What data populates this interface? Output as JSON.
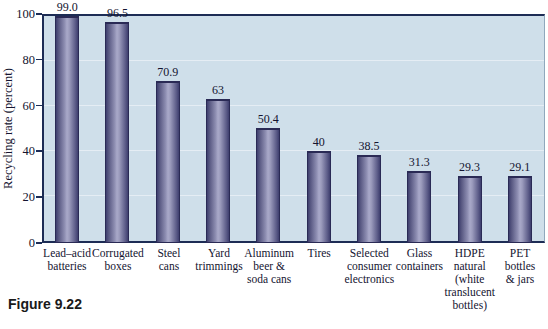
{
  "figure": {
    "caption": "Figure 9.22"
  },
  "colors": {
    "plot_background": "#cfdfea",
    "axis": "#1d2c55",
    "gridline": "#e9f0f6",
    "bar_edge": "#3e3e6e",
    "bar_center": "#a9a9c9",
    "bar_outline": "#2a2a55",
    "text": "#141430"
  },
  "chart_data": {
    "type": "bar",
    "title": "",
    "xlabel": "",
    "ylabel": "Recycling rate (percent)",
    "ylim": [
      0,
      100
    ],
    "yticks": [
      0,
      20,
      40,
      60,
      80,
      100
    ],
    "grid": true,
    "legend": false,
    "categories": [
      "Lead–acid\nbatteries",
      "Corrugated\nboxes",
      "Steel\ncans",
      "Yard\ntrimmings",
      "Aluminum\nbeer &\nsoda cans",
      "Tires",
      "Selected\nconsumer\nelectronics",
      "Glass\ncontainers",
      "HDPE\nnatural\n(white\ntranslucent\nbottles)",
      "PET\nbottles\n& jars"
    ],
    "values": [
      99.0,
      96.5,
      70.9,
      63,
      50.4,
      40,
      38.5,
      31.3,
      29.3,
      29.1
    ],
    "value_labels": [
      "99.0",
      "96.5",
      "70.9",
      "63",
      "50.4",
      "40",
      "38.5",
      "31.3",
      "29.3",
      "29.1"
    ]
  }
}
